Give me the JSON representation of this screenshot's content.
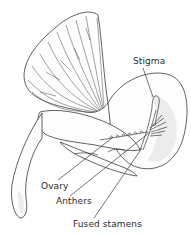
{
  "diagram": {
    "labels": [
      {
        "id": "stigma",
        "text": "Stigma"
      },
      {
        "id": "ovary",
        "text": "Ovary"
      },
      {
        "id": "anthers",
        "text": "Anthers"
      },
      {
        "id": "fused_stamens",
        "text": "Fused stamens"
      }
    ],
    "colors": {
      "line": "#3a3a3a",
      "text": "#2a2a2a",
      "background": "#ffffff",
      "shading": "#ececec"
    }
  }
}
